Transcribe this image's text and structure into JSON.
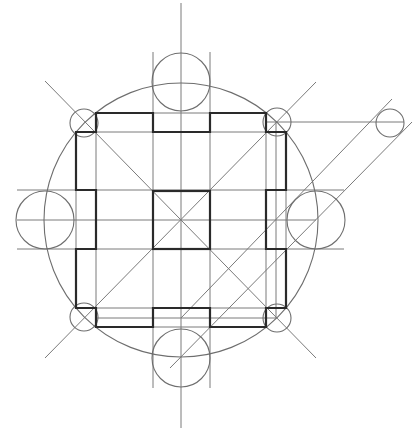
{
  "diagram": {
    "title": "",
    "colors": {
      "background": "#ffffff",
      "thin_line": "#7a7a7a",
      "circle_line": "#6e6e6e",
      "thick_line": "#2a2a2a"
    },
    "center": [
      181,
      220
    ],
    "big_circle": {
      "cx": 181,
      "cy": 220,
      "r": 137
    },
    "satellite_circles": [
      {
        "name": "top",
        "cx": 181,
        "cy": 82,
        "r": 29
      },
      {
        "name": "bottom",
        "cx": 181,
        "cy": 358,
        "r": 29
      },
      {
        "name": "left",
        "cx": 45,
        "cy": 220,
        "r": 29
      },
      {
        "name": "right",
        "cx": 316,
        "cy": 220,
        "r": 29
      }
    ],
    "corner_circles": [
      {
        "name": "top-left",
        "cx": 84,
        "cy": 123,
        "r": 14
      },
      {
        "name": "top-right",
        "cx": 277,
        "cy": 122,
        "r": 14
      },
      {
        "name": "bottom-left",
        "cx": 84,
        "cy": 317,
        "r": 14
      },
      {
        "name": "bottom-right",
        "cx": 277,
        "cy": 318,
        "r": 14
      },
      {
        "name": "outer-right",
        "cx": 390,
        "cy": 123,
        "r": 14
      }
    ]
  }
}
